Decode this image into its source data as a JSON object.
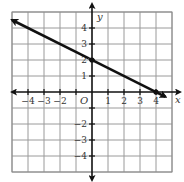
{
  "chart_data": {
    "type": "line",
    "title": "",
    "xlabel": "x",
    "ylabel": "y",
    "origin_label": "O",
    "xlim": [
      -5,
      5
    ],
    "ylim": [
      -5,
      5
    ],
    "grid": true,
    "x_tick_labels": [
      "−4",
      "−3",
      "−2",
      "1",
      "2",
      "3",
      "4"
    ],
    "x_tick_values": [
      -4,
      -3,
      -2,
      1,
      2,
      3,
      4
    ],
    "y_tick_labels": [
      "4",
      "3",
      "2",
      "1",
      "−2",
      "−3",
      "−4"
    ],
    "y_tick_values": [
      4,
      3,
      2,
      1,
      -2,
      -3,
      -4
    ],
    "series": [
      {
        "name": "line",
        "equation": "y = -1/2 x + 2",
        "slope": -0.5,
        "intercept": 2,
        "x": [
          -5,
          4.6
        ],
        "y": [
          4.5,
          -0.3
        ],
        "marked_points": [
          {
            "x": 0,
            "y": 2
          },
          {
            "x": 4,
            "y": 0
          }
        ],
        "arrows_both_ends": true
      }
    ]
  }
}
